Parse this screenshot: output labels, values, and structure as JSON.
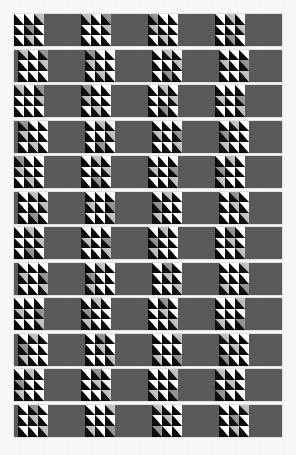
{
  "artwork": {
    "title": "Diagonal half-square triangle band pattern",
    "caption": "",
    "page_background": "#f8f8f6",
    "band_background": "#575757",
    "plain_square_color": "#5a5a5a",
    "motif_dark_color": "#0a0a0a",
    "motif_light_color": "#ffffff",
    "canvas": {
      "width": 296,
      "height": 455
    }
  },
  "layout": {
    "band_count": 12,
    "band_left": 14,
    "band_width": 268,
    "band_height": 32,
    "band_pitch": 35.5,
    "first_band_top": 14,
    "block_size": 30,
    "block_pitch": 67,
    "odd_row_offset": 0,
    "even_row_offset": -33,
    "motif_grid": 3
  },
  "motif": {
    "name": "half-square-triangle",
    "description": "square cell split on the anti-diagonal, white upper-right, black lower-left",
    "cells_per_block": 9,
    "shades": [
      "bright",
      "soft",
      "dim"
    ]
  },
  "bands": [
    {
      "index": 1,
      "phase": "start-motif",
      "blocks": [
        "motif",
        "gray",
        "motif",
        "gray",
        "motif",
        "gray",
        "motif",
        "gray",
        "motif"
      ]
    },
    {
      "index": 2,
      "phase": "start-gray",
      "blocks": [
        "gray",
        "motif",
        "gray",
        "motif",
        "gray",
        "motif",
        "gray",
        "motif",
        "gray"
      ]
    },
    {
      "index": 3,
      "phase": "start-motif",
      "blocks": [
        "motif",
        "gray",
        "motif",
        "gray",
        "motif",
        "gray",
        "motif",
        "gray",
        "motif"
      ]
    },
    {
      "index": 4,
      "phase": "start-gray",
      "blocks": [
        "gray",
        "motif",
        "gray",
        "motif",
        "gray",
        "motif",
        "gray",
        "motif",
        "gray"
      ]
    },
    {
      "index": 5,
      "phase": "start-motif",
      "blocks": [
        "motif",
        "gray",
        "motif",
        "gray",
        "motif",
        "gray",
        "motif",
        "gray",
        "motif"
      ]
    },
    {
      "index": 6,
      "phase": "start-gray",
      "blocks": [
        "gray",
        "motif",
        "gray",
        "motif",
        "gray",
        "motif",
        "gray",
        "motif",
        "gray"
      ]
    },
    {
      "index": 7,
      "phase": "start-motif",
      "blocks": [
        "motif",
        "gray",
        "motif",
        "gray",
        "motif",
        "gray",
        "motif",
        "gray",
        "motif"
      ]
    },
    {
      "index": 8,
      "phase": "start-gray",
      "blocks": [
        "gray",
        "motif",
        "gray",
        "motif",
        "gray",
        "motif",
        "gray",
        "motif",
        "gray"
      ]
    },
    {
      "index": 9,
      "phase": "start-motif",
      "blocks": [
        "motif",
        "gray",
        "motif",
        "gray",
        "motif",
        "gray",
        "motif",
        "gray",
        "motif"
      ]
    },
    {
      "index": 10,
      "phase": "start-gray",
      "blocks": [
        "gray",
        "motif",
        "gray",
        "motif",
        "gray",
        "motif",
        "gray",
        "motif",
        "gray"
      ]
    },
    {
      "index": 11,
      "phase": "start-motif",
      "blocks": [
        "motif",
        "gray",
        "motif",
        "gray",
        "motif",
        "gray",
        "motif",
        "gray",
        "motif"
      ]
    },
    {
      "index": 12,
      "phase": "start-gray",
      "blocks": [
        "gray",
        "motif",
        "gray",
        "motif",
        "gray",
        "motif",
        "gray",
        "motif",
        "gray"
      ]
    }
  ]
}
